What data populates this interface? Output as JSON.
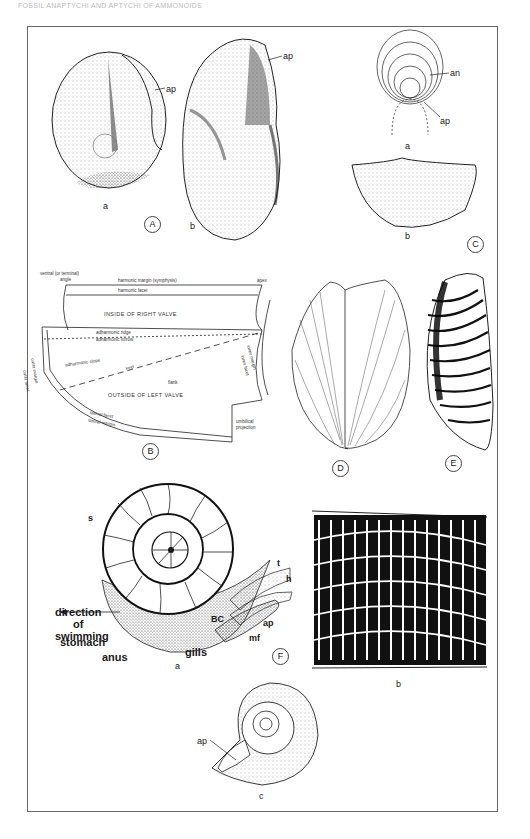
{
  "header": {
    "text": "FOSSIL ANAPTYCHI AND APTYCHI OF AMMONOIDS"
  },
  "panels": {
    "A": {
      "label": "A",
      "sub_a": "a",
      "sub_b": "b",
      "ap_a": "ap",
      "ap_b": "ap"
    },
    "B": {
      "label": "B",
      "annotations": {
        "ventral_angle_1": "ventral (or terminal)",
        "ventral_angle_2": "angle",
        "harmonic_margin": "harmonic margin (symphysis)",
        "apex": "apex",
        "harmonic_facet": "harmonic facet",
        "inside_right": "INSIDE OF RIGHT VALVE",
        "adharmonic_ridge": "adharmonic ridge",
        "adharmonic_furrow": "adharmonic furrow",
        "adharmonic_slope": "adharmonic slope",
        "keel": "keel",
        "flank": "flank",
        "outside_left": "OUTSIDE OF LEFT VALVE",
        "outer_facet": "outer facet",
        "outer_margin": "outer margin",
        "inner_margin": "inner margin",
        "inner_facet": "inner facet",
        "lateral_facet": "lateral facet",
        "lateral_margin": "lateral margin",
        "umbilical_1": "umbilical",
        "umbilical_2": "projection"
      }
    },
    "C": {
      "label": "C",
      "sub_a": "a",
      "sub_b": "b",
      "an": "an",
      "ap": "ap"
    },
    "D": {
      "label": "D"
    },
    "E": {
      "label": "E"
    },
    "F": {
      "label": "F",
      "sub_a": "a",
      "sub_b": "b",
      "sub_c": "c",
      "s": "s",
      "t": "t",
      "h": "h",
      "ap": "ap",
      "mf": "mf",
      "bc": "BC",
      "gills": "gills",
      "anus": "anus",
      "stomach": "stomach",
      "direction_1": "direction",
      "direction_2": "of",
      "direction_3": "swimming",
      "ap_c": "ap"
    }
  },
  "colors": {
    "ink": "#1a1a1a",
    "frame": "#666666",
    "paper": "#ffffff"
  }
}
